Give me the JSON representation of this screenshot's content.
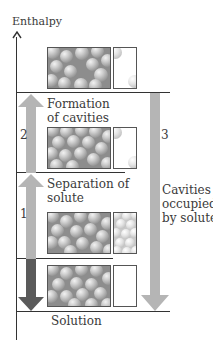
{
  "diagram": {
    "axis_label": "Enthalpy",
    "arrows": {
      "step1": {
        "number": "1",
        "label_line1": "Separation of",
        "label_line2": "solute",
        "direction": "up"
      },
      "step2": {
        "number": "2",
        "label_line1": "Formation",
        "label_line2": "of cavities",
        "direction": "up"
      },
      "step3": {
        "number": "3",
        "label_line1": "Cavities",
        "label_line2": "occupied",
        "label_line3": "by solute",
        "direction": "down"
      },
      "net": {
        "direction": "down"
      }
    },
    "bottom_label": "Solution",
    "levels": [
      {
        "name": "solvent with cavities + separated solute"
      },
      {
        "name": "solvent with cavities + solid solute"
      },
      {
        "name": "pure solvent + solid solute"
      },
      {
        "name": "solution"
      }
    ],
    "colors": {
      "axis": "#333333",
      "light_arrow": "#b5b5b5",
      "dark_arrow": "#5a5a5a",
      "solvent_sphere": "#9a9a9a",
      "solute_sphere": "#d9d9d9"
    }
  }
}
